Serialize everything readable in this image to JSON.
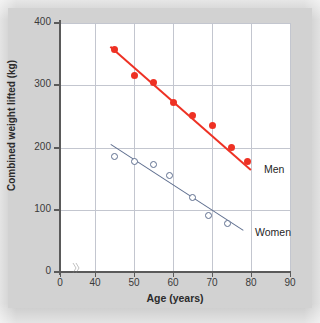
{
  "figure": {
    "background_color": "#c9c9c9",
    "panel_color": "#ffffff"
  },
  "chart_data": {
    "type": "scatter",
    "title": "",
    "xlabel": "Age (years)",
    "ylabel": "Combined weight lifted (kg)",
    "xlim": [
      40,
      90
    ],
    "ylim": [
      0,
      400
    ],
    "x_broken_axis": true,
    "x_break_after": 0,
    "xticks": [
      0,
      40,
      50,
      60,
      70,
      80,
      90
    ],
    "yticks": [
      0,
      100,
      200,
      300,
      400
    ],
    "grid": "both",
    "legend": "inline-right",
    "series": [
      {
        "name": "Men",
        "color": "#ee3124",
        "marker": "filled-circle",
        "label": "Men",
        "points": [
          {
            "x": 45,
            "y": 358
          },
          {
            "x": 50,
            "y": 315
          },
          {
            "x": 55,
            "y": 305
          },
          {
            "x": 60,
            "y": 272
          },
          {
            "x": 65,
            "y": 252
          },
          {
            "x": 70,
            "y": 235
          },
          {
            "x": 75,
            "y": 200
          },
          {
            "x": 79,
            "y": 177
          }
        ],
        "fit_line": {
          "x1": 44,
          "y1": 363,
          "x2": 80,
          "y2": 165
        }
      },
      {
        "name": "Women",
        "color": "#5f6f8f",
        "marker": "open-circle",
        "label": "Women",
        "points": [
          {
            "x": 45,
            "y": 185
          },
          {
            "x": 50,
            "y": 178
          },
          {
            "x": 55,
            "y": 172
          },
          {
            "x": 59,
            "y": 155
          },
          {
            "x": 65,
            "y": 120
          },
          {
            "x": 69,
            "y": 91
          },
          {
            "x": 74,
            "y": 78
          }
        ],
        "fit_line": {
          "x1": 44,
          "y1": 205,
          "x2": 78,
          "y2": 67
        }
      }
    ]
  },
  "axis": {
    "y_tick_labels": [
      "400",
      "300",
      "200",
      "100",
      "0"
    ],
    "x_tick_labels": [
      "0",
      "40",
      "50",
      "60",
      "70",
      "80",
      "90"
    ],
    "y_title": "Combined weight lifted (kg)",
    "x_title": "Age (years)"
  },
  "annotations": {
    "men_label": "Men",
    "women_label": "Women",
    "axis_break_icon": "axis-break-icon"
  }
}
